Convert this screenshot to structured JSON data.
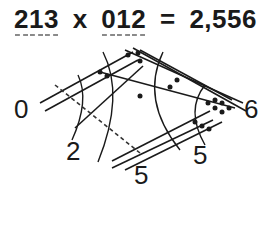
{
  "equation": {
    "multiplicand_digits": [
      "2",
      "1",
      "3"
    ],
    "operator": "x",
    "multiplier_digits": [
      "0",
      "1",
      "2"
    ],
    "equals": "=",
    "result": "2,556"
  },
  "diagram": {
    "method": "line multiplication",
    "group_labels": {
      "left": "0",
      "bottom_left": "2",
      "bottom": "5",
      "bottom_right": "5",
      "right": "6"
    },
    "colors": {
      "line": "#1a1a1a",
      "dashed_line": "#333333",
      "underline": "#8a8a8a"
    }
  }
}
